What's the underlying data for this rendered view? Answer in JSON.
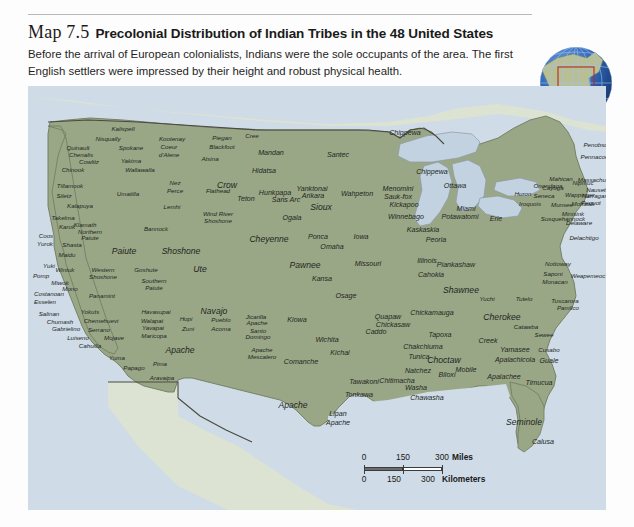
{
  "header": {
    "map_number": "Map 7.5",
    "title": "Precolonial Distribution of Indian Tribes in the 48 United States",
    "caption": "Before the arrival of European colonialists, Indians were the sole occupants of the area. The first English settlers were impressed by their height and robust physical health."
  },
  "inset": {
    "name": "globe-inset",
    "description": "Globe showing North America with highlight box"
  },
  "colors": {
    "land_us": "#9aa786",
    "land_neighbor": "#dce3d2",
    "water": "#cfdbe6",
    "lake": "#c3d2e0",
    "border": "#4a4a3f",
    "coast": "#7e8a74",
    "page": "#fdfdfd",
    "text": "#22261f",
    "globe_blue": "#2a5fb0",
    "globe_highlight": "#b52a1f"
  },
  "scale": {
    "miles": {
      "ticks": [
        "0",
        "150",
        "300"
      ],
      "unit": "Miles"
    },
    "kilometers": {
      "ticks": [
        "0",
        "150",
        "300"
      ],
      "unit": "Kilometers"
    }
  },
  "labels": [
    {
      "t": "Kalispell",
      "x": 95,
      "y": 43,
      "s": "sz-s"
    },
    {
      "t": "Nisqually",
      "x": 80,
      "y": 53,
      "s": "sz-s"
    },
    {
      "t": "Kootenay",
      "x": 144,
      "y": 53,
      "s": "sz-s"
    },
    {
      "t": "Piegan",
      "x": 194,
      "y": 52,
      "s": "sz-s"
    },
    {
      "t": "Cree",
      "x": 224,
      "y": 50,
      "s": "sz-s"
    },
    {
      "t": "Quinault",
      "x": 50,
      "y": 62,
      "s": "sz-s"
    },
    {
      "t": "Spokane",
      "x": 103,
      "y": 62,
      "s": "sz-s"
    },
    {
      "t": "Coeur",
      "x": 141,
      "y": 61,
      "s": "sz-s"
    },
    {
      "t": "Blackfoot",
      "x": 194,
      "y": 61,
      "s": "sz-s"
    },
    {
      "t": "Chenalis",
      "x": 53,
      "y": 69,
      "s": "sz-s"
    },
    {
      "t": "d'Alene",
      "x": 141,
      "y": 69,
      "s": "sz-s"
    },
    {
      "t": "Mandan",
      "x": 243,
      "y": 68,
      "s": "sz-m"
    },
    {
      "t": "Santec",
      "x": 310,
      "y": 70,
      "s": "sz-m"
    },
    {
      "t": "Chippewa",
      "x": 377,
      "y": 48,
      "s": "sz-m"
    },
    {
      "t": "Cowlitz",
      "x": 61,
      "y": 76,
      "s": "sz-s"
    },
    {
      "t": "Yakima",
      "x": 103,
      "y": 75,
      "s": "sz-s"
    },
    {
      "t": "Atsina",
      "x": 182,
      "y": 73,
      "s": "sz-s"
    },
    {
      "t": "Chinook",
      "x": 45,
      "y": 84,
      "s": "sz-s"
    },
    {
      "t": "Wallawalla",
      "x": 112,
      "y": 84,
      "s": "sz-s"
    },
    {
      "t": "Hidatsa",
      "x": 236,
      "y": 86,
      "s": "sz-m"
    },
    {
      "t": "Chippewa",
      "x": 404,
      "y": 87,
      "s": "sz-m"
    },
    {
      "t": "Tillamook",
      "x": 42,
      "y": 100,
      "s": "sz-s"
    },
    {
      "t": "Nez",
      "x": 147,
      "y": 97,
      "s": "sz-s"
    },
    {
      "t": "Crow",
      "x": 199,
      "y": 100,
      "s": "sz-l"
    },
    {
      "t": "Ottawa",
      "x": 427,
      "y": 101,
      "s": "sz-m"
    },
    {
      "t": "Siletz",
      "x": 36,
      "y": 110,
      "s": "sz-s"
    },
    {
      "t": "Umatilla",
      "x": 100,
      "y": 108,
      "s": "sz-s"
    },
    {
      "t": "Perce",
      "x": 147,
      "y": 105,
      "s": "sz-s"
    },
    {
      "t": "Flathead",
      "x": 190,
      "y": 105,
      "s": "sz-s"
    },
    {
      "t": "Hunkpapa",
      "x": 247,
      "y": 108,
      "s": "sz-m"
    },
    {
      "t": "Yanktonai",
      "x": 284,
      "y": 104,
      "s": "sz-m"
    },
    {
      "t": "Wahpeton",
      "x": 329,
      "y": 109,
      "s": "sz-m"
    },
    {
      "t": "Menomini",
      "x": 370,
      "y": 104,
      "s": "sz-m"
    },
    {
      "t": "Huron",
      "x": 495,
      "y": 108,
      "s": "sz-s"
    },
    {
      "t": "Cayuga",
      "x": 525,
      "y": 102,
      "s": "sz-s"
    },
    {
      "t": "Nipmuc",
      "x": 555,
      "y": 97,
      "s": "sz-s"
    },
    {
      "t": "Kalapuya",
      "x": 52,
      "y": 120,
      "s": "sz-s"
    },
    {
      "t": "Teton",
      "x": 218,
      "y": 114,
      "s": "sz-m"
    },
    {
      "t": "Sans Arc",
      "x": 258,
      "y": 115,
      "s": "sz-m"
    },
    {
      "t": "Arikara",
      "x": 285,
      "y": 111,
      "s": "sz-m"
    },
    {
      "t": "Sauk-fox",
      "x": 370,
      "y": 112,
      "s": "sz-m"
    },
    {
      "t": "Kickapoo",
      "x": 376,
      "y": 120,
      "s": "sz-m"
    },
    {
      "t": "Seneca",
      "x": 516,
      "y": 110,
      "s": "sz-s"
    },
    {
      "t": "Wappinger",
      "x": 552,
      "y": 109,
      "s": "sz-s"
    },
    {
      "t": "Lemhi",
      "x": 144,
      "y": 121,
      "s": "sz-s"
    },
    {
      "t": "Sioux",
      "x": 293,
      "y": 122,
      "s": "sz-l"
    },
    {
      "t": "Iroquois",
      "x": 502,
      "y": 118,
      "s": "sz-s"
    },
    {
      "t": "Munsee",
      "x": 534,
      "y": 119,
      "s": "sz-s"
    },
    {
      "t": "Mohawk",
      "x": 555,
      "y": 118,
      "s": "sz-s"
    },
    {
      "t": "Takelma",
      "x": 35,
      "y": 132,
      "s": "sz-s"
    },
    {
      "t": "Wind River",
      "x": 190,
      "y": 128,
      "s": "sz-s"
    },
    {
      "t": "Winnebago",
      "x": 378,
      "y": 132,
      "s": "sz-m"
    },
    {
      "t": "Potawatomi",
      "x": 432,
      "y": 132,
      "s": "sz-m"
    },
    {
      "t": "Susquehannock",
      "x": 535,
      "y": 133,
      "s": "sz-s"
    },
    {
      "t": "Klamath",
      "x": 57,
      "y": 139,
      "s": "sz-s"
    },
    {
      "t": "Karok",
      "x": 39,
      "y": 141,
      "s": "sz-s"
    },
    {
      "t": "Shoshone",
      "x": 190,
      "y": 135,
      "s": "sz-s"
    },
    {
      "t": "Ogala",
      "x": 264,
      "y": 133,
      "s": "sz-m"
    },
    {
      "t": "Bannock",
      "x": 128,
      "y": 143,
      "s": "sz-s"
    },
    {
      "t": "Northern",
      "x": 62,
      "y": 146,
      "s": "sz-s"
    },
    {
      "t": "Erie",
      "x": 468,
      "y": 134,
      "s": "sz-m"
    },
    {
      "t": "Miami",
      "x": 438,
      "y": 124,
      "s": "sz-m"
    },
    {
      "t": "Coos",
      "x": 18,
      "y": 150,
      "s": "sz-s"
    },
    {
      "t": "Paiute",
      "x": 62,
      "y": 152,
      "s": "sz-s"
    },
    {
      "t": "Kaskaskia",
      "x": 395,
      "y": 145,
      "s": "sz-m"
    },
    {
      "t": "Delachtigo",
      "x": 556,
      "y": 152,
      "s": "sz-s"
    },
    {
      "t": "Yurok",
      "x": 17,
      "y": 158,
      "s": "sz-s"
    },
    {
      "t": "Shasta",
      "x": 44,
      "y": 159,
      "s": "sz-s"
    },
    {
      "t": "Cheyenne",
      "x": 241,
      "y": 154,
      "s": "sz-l"
    },
    {
      "t": "Ponca",
      "x": 290,
      "y": 152,
      "s": "sz-m"
    },
    {
      "t": "Iowa",
      "x": 333,
      "y": 152,
      "s": "sz-m"
    },
    {
      "t": "Peoria",
      "x": 408,
      "y": 155,
      "s": "sz-m"
    },
    {
      "t": "Maidu",
      "x": 39,
      "y": 169,
      "s": "sz-s"
    },
    {
      "t": "Paiute",
      "x": 96,
      "y": 166,
      "s": "sz-l"
    },
    {
      "t": "Shoshone",
      "x": 153,
      "y": 166,
      "s": "sz-l"
    },
    {
      "t": "Pawnee",
      "x": 277,
      "y": 180,
      "s": "sz-l"
    },
    {
      "t": "Omaha",
      "x": 304,
      "y": 162,
      "s": "sz-m"
    },
    {
      "t": "Missouri",
      "x": 340,
      "y": 179,
      "s": "sz-m"
    },
    {
      "t": "Illinois",
      "x": 399,
      "y": 176,
      "s": "sz-m"
    },
    {
      "t": "Yuki",
      "x": 21,
      "y": 180,
      "s": "sz-s"
    },
    {
      "t": "Wintuk",
      "x": 37,
      "y": 184,
      "s": "sz-s"
    },
    {
      "t": "Ute",
      "x": 172,
      "y": 184,
      "s": "sz-l"
    },
    {
      "t": "Cahokia",
      "x": 403,
      "y": 190,
      "s": "sz-m"
    },
    {
      "t": "Pomp",
      "x": 13,
      "y": 190,
      "s": "sz-s"
    },
    {
      "t": "Western",
      "x": 75,
      "y": 184,
      "s": "sz-s"
    },
    {
      "t": "Goshute",
      "x": 118,
      "y": 184,
      "s": "sz-s"
    },
    {
      "t": "Piankashaw",
      "x": 428,
      "y": 180,
      "s": "sz-m"
    },
    {
      "t": "Shoshone",
      "x": 75,
      "y": 191,
      "s": "sz-s"
    },
    {
      "t": "Kansa",
      "x": 294,
      "y": 194,
      "s": "sz-m"
    },
    {
      "t": "Nottoway",
      "x": 530,
      "y": 178,
      "s": "sz-s"
    },
    {
      "t": "Weapemeoc",
      "x": 560,
      "y": 190,
      "s": "sz-s"
    },
    {
      "t": "Miwok",
      "x": 32,
      "y": 197,
      "s": "sz-s"
    },
    {
      "t": "Southern",
      "x": 126,
      "y": 195,
      "s": "sz-s"
    },
    {
      "t": "Saponi",
      "x": 525,
      "y": 188,
      "s": "sz-s"
    },
    {
      "t": "Mono",
      "x": 42,
      "y": 203,
      "s": "sz-s"
    },
    {
      "t": "Paiute",
      "x": 126,
      "y": 202,
      "s": "sz-s"
    },
    {
      "t": "Monacan",
      "x": 527,
      "y": 196,
      "s": "sz-s"
    },
    {
      "t": "Costanoan",
      "x": 21,
      "y": 208,
      "s": "sz-s"
    },
    {
      "t": "Panamint",
      "x": 74,
      "y": 210,
      "s": "sz-s"
    },
    {
      "t": "Osage",
      "x": 318,
      "y": 211,
      "s": "sz-m"
    },
    {
      "t": "Shawnee",
      "x": 433,
      "y": 205,
      "s": "sz-l"
    },
    {
      "t": "Esselen",
      "x": 17,
      "y": 216,
      "s": "sz-s"
    },
    {
      "t": "Tutelo",
      "x": 496,
      "y": 213,
      "s": "sz-s"
    },
    {
      "t": "Tuscarora",
      "x": 537,
      "y": 215,
      "s": "sz-s"
    },
    {
      "t": "Salinan",
      "x": 21,
      "y": 228,
      "s": "sz-s"
    },
    {
      "t": "Yokuts",
      "x": 62,
      "y": 226,
      "s": "sz-s"
    },
    {
      "t": "Havasupai",
      "x": 128,
      "y": 226,
      "s": "sz-s"
    },
    {
      "t": "Navajo",
      "x": 186,
      "y": 226,
      "s": "sz-l"
    },
    {
      "t": "Yuchi",
      "x": 459,
      "y": 213,
      "s": "sz-s"
    },
    {
      "t": "Pamlico",
      "x": 540,
      "y": 222,
      "s": "sz-s"
    },
    {
      "t": "Chumash",
      "x": 32,
      "y": 236,
      "s": "sz-s"
    },
    {
      "t": "Chemehuevi",
      "x": 73,
      "y": 235,
      "s": "sz-s"
    },
    {
      "t": "Walapai",
      "x": 124,
      "y": 235,
      "s": "sz-s"
    },
    {
      "t": "Hopi",
      "x": 158,
      "y": 233,
      "s": "sz-s"
    },
    {
      "t": "Pueblo",
      "x": 193,
      "y": 234,
      "s": "sz-s"
    },
    {
      "t": "Jicarilla",
      "x": 228,
      "y": 231,
      "s": "sz-s"
    },
    {
      "t": "Kiowa",
      "x": 269,
      "y": 235,
      "s": "sz-m"
    },
    {
      "t": "Chickamauga",
      "x": 404,
      "y": 228,
      "s": "sz-m"
    },
    {
      "t": "Cherokee",
      "x": 474,
      "y": 232,
      "s": "sz-l"
    },
    {
      "t": "Catawba",
      "x": 498,
      "y": 241,
      "s": "sz-s"
    },
    {
      "t": "Gabrielino",
      "x": 38,
      "y": 243,
      "s": "sz-s"
    },
    {
      "t": "Serrano",
      "x": 71,
      "y": 244,
      "s": "sz-s"
    },
    {
      "t": "Yavapai",
      "x": 125,
      "y": 242,
      "s": "sz-s"
    },
    {
      "t": "Zuni",
      "x": 160,
      "y": 243,
      "s": "sz-s"
    },
    {
      "t": "Acoma",
      "x": 193,
      "y": 243,
      "s": "sz-s"
    },
    {
      "t": "Apache",
      "x": 229,
      "y": 237,
      "s": "sz-s"
    },
    {
      "t": "Quapaw",
      "x": 360,
      "y": 232,
      "s": "sz-m"
    },
    {
      "t": "Sewee",
      "x": 516,
      "y": 249,
      "s": "sz-s"
    },
    {
      "t": "Luiseno",
      "x": 50,
      "y": 252,
      "s": "sz-s"
    },
    {
      "t": "Mojave",
      "x": 86,
      "y": 252,
      "s": "sz-s"
    },
    {
      "t": "Maricopa",
      "x": 126,
      "y": 250,
      "s": "sz-s"
    },
    {
      "t": "Santo",
      "x": 230,
      "y": 245,
      "s": "sz-s"
    },
    {
      "t": "Chickasaw",
      "x": 365,
      "y": 240,
      "s": "sz-m"
    },
    {
      "t": "Cahuilla",
      "x": 62,
      "y": 260,
      "s": "sz-s"
    },
    {
      "t": "Domingo",
      "x": 230,
      "y": 251,
      "s": "sz-s"
    },
    {
      "t": "Apache",
      "x": 152,
      "y": 265,
      "s": "sz-l"
    },
    {
      "t": "Apache",
      "x": 234,
      "y": 264,
      "s": "sz-s"
    },
    {
      "t": "Wichita",
      "x": 299,
      "y": 255,
      "s": "sz-m"
    },
    {
      "t": "Caddo",
      "x": 348,
      "y": 247,
      "s": "sz-m"
    },
    {
      "t": "Creek",
      "x": 460,
      "y": 256,
      "s": "sz-m"
    },
    {
      "t": "Yamasee",
      "x": 487,
      "y": 265,
      "s": "sz-m"
    },
    {
      "t": "Cusabo",
      "x": 521,
      "y": 264,
      "s": "sz-s"
    },
    {
      "t": "Tapoxa",
      "x": 412,
      "y": 250,
      "s": "sz-m"
    },
    {
      "t": "Mescalero",
      "x": 234,
      "y": 271,
      "s": "sz-s"
    },
    {
      "t": "Kichai",
      "x": 312,
      "y": 268,
      "s": "sz-m"
    },
    {
      "t": "Chakchiuma",
      "x": 395,
      "y": 262,
      "s": "sz-m"
    },
    {
      "t": "Choctaw",
      "x": 416,
      "y": 275,
      "s": "sz-l"
    },
    {
      "t": "Apalachicola",
      "x": 487,
      "y": 275,
      "s": "sz-m"
    },
    {
      "t": "Guale",
      "x": 521,
      "y": 276,
      "s": "sz-m"
    },
    {
      "t": "Yuma",
      "x": 89,
      "y": 272,
      "s": "sz-s"
    },
    {
      "t": "Papago",
      "x": 106,
      "y": 282,
      "s": "sz-s"
    },
    {
      "t": "Pima",
      "x": 132,
      "y": 278,
      "s": "sz-s"
    },
    {
      "t": "Comanche",
      "x": 273,
      "y": 277,
      "s": "sz-m"
    },
    {
      "t": "Tunica",
      "x": 391,
      "y": 272,
      "s": "sz-m"
    },
    {
      "t": "Mobile",
      "x": 438,
      "y": 285,
      "s": "sz-m"
    },
    {
      "t": "Aravaipa",
      "x": 134,
      "y": 292,
      "s": "sz-s"
    },
    {
      "t": "Natchez",
      "x": 390,
      "y": 286,
      "s": "sz-m"
    },
    {
      "t": "Biloxi",
      "x": 419,
      "y": 290,
      "s": "sz-m"
    },
    {
      "t": "Chitimacha",
      "x": 369,
      "y": 296,
      "s": "sz-m"
    },
    {
      "t": "Apalachee",
      "x": 476,
      "y": 292,
      "s": "sz-m"
    },
    {
      "t": "Tawakoni",
      "x": 336,
      "y": 297,
      "s": "sz-m"
    },
    {
      "t": "Washa",
      "x": 388,
      "y": 303,
      "s": "sz-m"
    },
    {
      "t": "Timucua",
      "x": 511,
      "y": 298,
      "s": "sz-m"
    },
    {
      "t": "Apache",
      "x": 265,
      "y": 320,
      "s": "sz-l"
    },
    {
      "t": "Tonkawa",
      "x": 331,
      "y": 310,
      "s": "sz-m"
    },
    {
      "t": "Chawasha",
      "x": 399,
      "y": 313,
      "s": "sz-m"
    },
    {
      "t": "Lipan",
      "x": 310,
      "y": 329,
      "s": "sz-m"
    },
    {
      "t": "Apache",
      "x": 310,
      "y": 338,
      "s": "sz-m"
    },
    {
      "t": "Seminole",
      "x": 496,
      "y": 337,
      "s": "sz-l"
    },
    {
      "t": "Calusa",
      "x": 515,
      "y": 357,
      "s": "sz-m"
    },
    {
      "t": "Penobscot",
      "x": 570,
      "y": 59,
      "s": "sz-s"
    },
    {
      "t": "Pennacook",
      "x": 568,
      "y": 71,
      "s": "sz-s"
    },
    {
      "t": "Mahican",
      "x": 533,
      "y": 93,
      "s": "sz-s"
    },
    {
      "t": "Onondaga",
      "x": 520,
      "y": 100,
      "s": "sz-s"
    },
    {
      "t": "Massachuset",
      "x": 568,
      "y": 94,
      "s": "sz-s"
    },
    {
      "t": "Nauset",
      "x": 568,
      "y": 104,
      "s": "sz-s"
    },
    {
      "t": "Narragansett",
      "x": 572,
      "y": 110,
      "s": "sz-s"
    },
    {
      "t": "Pequot",
      "x": 563,
      "y": 117,
      "s": "sz-s"
    },
    {
      "t": "Minisink",
      "x": 545,
      "y": 128,
      "s": "sz-s"
    },
    {
      "t": "Delaware",
      "x": 551,
      "y": 137,
      "s": "sz-s"
    }
  ]
}
